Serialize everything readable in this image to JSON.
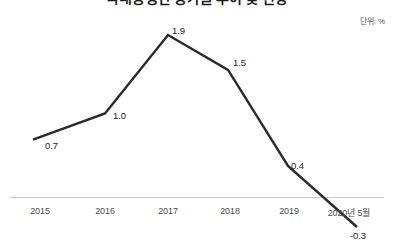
{
  "chart": {
    "title": "국내총생산 증가율 추이 및 전망",
    "unit_label": "단위: %"
  },
  "chart_data": {
    "type": "line",
    "title": "국내총생산 증가율 추이 및 전망",
    "xlabel": "",
    "ylabel": "",
    "unit": "%",
    "unit_label": "단위: %",
    "grid": false,
    "legend": false,
    "categories": [
      "2015",
      "2016",
      "2017",
      "2018",
      "2019",
      "2020년 5월"
    ],
    "values": [
      0.7,
      1.0,
      1.9,
      1.5,
      0.4,
      -0.3
    ],
    "point_labels": [
      "0.7",
      "1.0",
      "1.9",
      "1.5",
      "0.4",
      "-0.3"
    ],
    "ylim": [
      -0.3,
      1.9
    ],
    "zero_line_note": "axis baseline drawn near y = 0",
    "line_color": "#2a2a2a",
    "axis_color": "#c9c9c9"
  },
  "axis": {
    "tick_labels": [
      "2015",
      "2016",
      "2017",
      "2018",
      "2019",
      "2020년 5월"
    ]
  }
}
